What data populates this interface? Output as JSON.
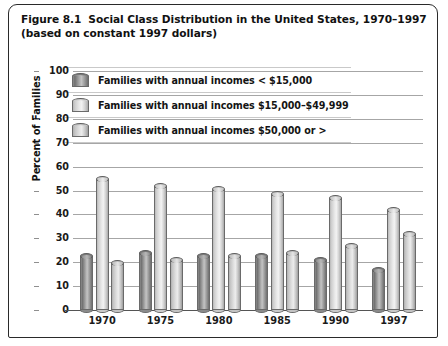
{
  "figure": {
    "number": "Figure 8.1",
    "title": "Social Class Distribution in the United States, 1970–1997",
    "subtitle": "(based on constant 1997 dollars)"
  },
  "legend": {
    "items": [
      {
        "icon": "cylinder-icon",
        "label": "Families with annual incomes < $15,000"
      },
      {
        "icon": "cylinder-icon",
        "label": "Families with annual incomes $15,000–$49,999"
      },
      {
        "icon": "cylinder-icon",
        "label": "Families with annual incomes $50,000 or >"
      }
    ]
  },
  "chart_data": {
    "type": "bar",
    "title": "Social Class Distribution in the United States, 1970–1997",
    "subtitle": "(based on constant 1997 dollars)",
    "xlabel": "",
    "ylabel": "Percent of Families",
    "categories": [
      "1970",
      "1975",
      "1980",
      "1985",
      "1990",
      "1997"
    ],
    "series": [
      {
        "name": "Families with annual incomes < $15,000",
        "values": [
          24,
          25,
          24,
          24,
          22,
          18
        ]
      },
      {
        "name": "Families with annual incomes $15,000–$49,999",
        "values": [
          56,
          53,
          52,
          50,
          48,
          43
        ]
      },
      {
        "name": "Families with annual incomes $50,000 or >",
        "values": [
          21,
          22,
          24,
          25,
          28,
          33
        ]
      }
    ],
    "ylim": [
      0,
      100
    ],
    "yticks": [
      0,
      10,
      20,
      30,
      40,
      50,
      60,
      70,
      80,
      90,
      100
    ],
    "ytick_labels": [
      "0",
      "10",
      "20",
      "30",
      "40",
      "50",
      "60",
      "70",
      "80",
      "90",
      "100"
    ],
    "grid": true,
    "legend_position": "top-inside"
  },
  "colors": {
    "frame": "#2a2a2a",
    "gridline": "#a6a6a6",
    "series_dark": "#8d8d8d",
    "series_light": "#eaeaea",
    "series_mid": "#c6c6c6",
    "text": "#111111"
  }
}
